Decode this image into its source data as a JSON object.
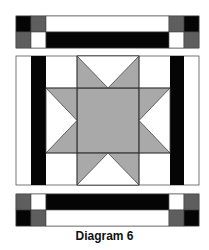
{
  "caption": "Diagram 6",
  "colors": {
    "black": "#050505",
    "dark_gray": "#5e5e5e",
    "star_gray": "#a9a9a9",
    "white": "#ffffff",
    "line": "#333333"
  },
  "top_strip": {
    "left_squares": [
      "black",
      "dark_gray",
      "dark_gray",
      "white"
    ],
    "bar_top": "white",
    "bar_bottom": "black",
    "right_squares": [
      "dark_gray",
      "black",
      "white",
      "dark_gray"
    ]
  },
  "center_block": {
    "side_bars": "black",
    "motif": "eight-point star",
    "star_fill": "star_gray"
  },
  "bottom_strip": {
    "left_squares": [
      "dark_gray",
      "white",
      "black",
      "dark_gray"
    ],
    "bar_top": "black",
    "bar_bottom": "white",
    "right_squares": [
      "white",
      "dark_gray",
      "dark_gray",
      "black"
    ]
  }
}
